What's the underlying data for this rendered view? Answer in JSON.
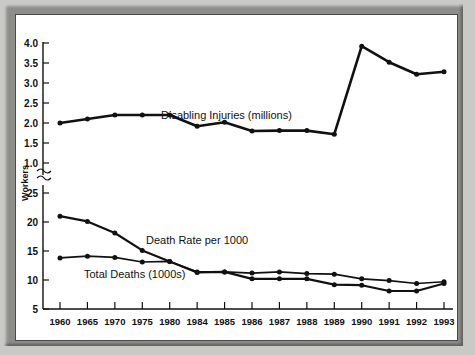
{
  "figure": {
    "y_axis_title": "Workers",
    "axis_break_symbol": "break-squiggle"
  },
  "chart_data": {
    "type": "line",
    "title": "",
    "xlabel": "",
    "ylabel": "Workers",
    "grid": false,
    "legend": "inline-annotations",
    "broken_axis": true,
    "categories": [
      "1960",
      "1965",
      "1970",
      "1975",
      "1980",
      "1984",
      "1985",
      "1986",
      "1987",
      "1988",
      "1989",
      "1990",
      "1991",
      "1992",
      "1993"
    ],
    "panels": [
      {
        "name": "upper",
        "ylim": [
          1.0,
          4.0
        ],
        "yticks": [
          "1.0",
          "1.5",
          "2.0",
          "2.5",
          "3.0",
          "3.5",
          "4.0"
        ],
        "ytick_values": [
          1.0,
          1.5,
          2.0,
          2.5,
          3.0,
          3.5,
          4.0
        ],
        "series": [
          {
            "name": "Disabling Injuries (millions)",
            "label": "Disabling Injuries (millions)",
            "values": [
              2.0,
              2.1,
              2.2,
              2.2,
              2.2,
              1.92,
              2.02,
              1.8,
              1.81,
              1.81,
              1.72,
              3.92,
              3.52,
              3.22,
              3.28
            ]
          }
        ]
      },
      {
        "name": "lower",
        "ylim": [
          5,
          25
        ],
        "yticks": [
          "5",
          "10",
          "15",
          "20",
          "25"
        ],
        "ytick_values": [
          5,
          10,
          15,
          20,
          25
        ],
        "series": [
          {
            "name": "Death Rate per 1000",
            "label": "Death Rate per 1000",
            "values": [
              21.0,
              20.1,
              18.1,
              15.1,
              13.2,
              11.3,
              11.4,
              10.2,
              10.2,
              10.2,
              9.2,
              9.1,
              8.1,
              8.1,
              9.4
            ]
          },
          {
            "name": "Total Deaths (1000s)",
            "label": "Total Deaths (1000s)",
            "values": [
              13.8,
              14.1,
              13.9,
              13.1,
              13.2,
              11.4,
              11.4,
              11.2,
              11.4,
              11.1,
              11.0,
              10.2,
              9.9,
              9.4,
              9.7
            ]
          }
        ]
      }
    ],
    "annotations": [
      {
        "text": "Disabling Injuries (millions)",
        "panel": "upper",
        "x_px": 145,
        "y_px": 104
      },
      {
        "text": "Death Rate per 1000",
        "panel": "lower",
        "x_px": 130,
        "y_px": 229
      },
      {
        "text": "Total Deaths (1000s)",
        "panel": "lower",
        "x_px": 68,
        "y_px": 263
      }
    ]
  },
  "colors": {
    "line": "#111111",
    "frame": "#8d8d8a",
    "plot_background": "#ffffff",
    "page_background": "#c9c9c5"
  }
}
